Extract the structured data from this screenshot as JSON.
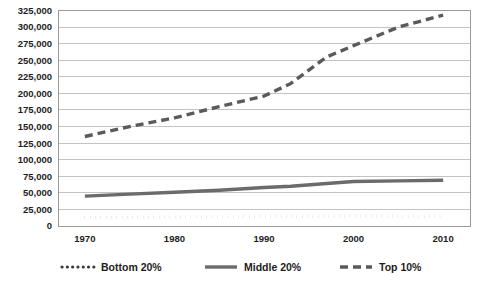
{
  "chart_data": {
    "type": "line",
    "title": "",
    "subtitle": "",
    "xlabel": "",
    "ylabel": "",
    "xlim": [
      1967,
      2013
    ],
    "ylim": [
      0,
      325000
    ],
    "grid": true,
    "legend_position": "bottom",
    "x_ticks": [
      "1970",
      "1980",
      "1990",
      "2000",
      "2010"
    ],
    "x_tick_values": [
      1970,
      1980,
      1990,
      2000,
      2010
    ],
    "y_ticks": [
      "0",
      "25,000",
      "50,000",
      "75,000",
      "100,000",
      "125,000",
      "150,000",
      "175,000",
      "200,000",
      "225,000",
      "250,000",
      "275,000",
      "300,000",
      "325,000"
    ],
    "y_tick_values": [
      0,
      25000,
      50000,
      75000,
      100000,
      125000,
      150000,
      175000,
      200000,
      225000,
      250000,
      275000,
      300000,
      325000
    ],
    "x": [
      1970,
      1975,
      1980,
      1985,
      1990,
      1993,
      1997,
      2000,
      2005,
      2010
    ],
    "series": [
      {
        "name": "Bottom 20%",
        "style": "dotted",
        "color": "#3a3a3a",
        "values": [
          13000,
          13500,
          13800,
          14000,
          14200,
          14300,
          14800,
          15000,
          14800,
          14500
        ]
      },
      {
        "name": "Middle 20%",
        "style": "solid",
        "color": "#6b6b6b",
        "values": [
          45000,
          48000,
          51000,
          54000,
          58000,
          60000,
          64000,
          67000,
          68000,
          69000
        ]
      },
      {
        "name": "Top 10%",
        "style": "dashed",
        "color": "#5a5a5a",
        "values": [
          135000,
          150000,
          163000,
          180000,
          196000,
          215000,
          255000,
          272000,
          300000,
          318000
        ]
      }
    ]
  },
  "legend": {
    "items": [
      {
        "label": "Bottom 20%",
        "style": "dotted"
      },
      {
        "label": "Middle 20%",
        "style": "solid"
      },
      {
        "label": "Top 10%",
        "style": "dashed"
      }
    ]
  },
  "colors": {
    "grid": "#a9a9a9",
    "border": "#8f8f8f",
    "text": "#1d1d1d",
    "bottom_series": "#3a3a3a",
    "middle_series": "#6b6b6b",
    "top_series": "#5a5a5a",
    "background": "#ffffff"
  }
}
